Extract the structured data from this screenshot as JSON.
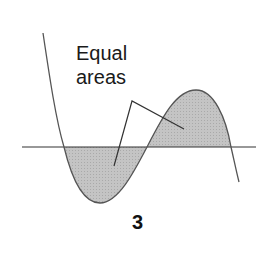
{
  "figure": {
    "annotation": {
      "line1": "Equal",
      "line2": "areas"
    },
    "panel_label": "3",
    "colors": {
      "curve": "#555555",
      "axis": "#333333",
      "fill": "#bdbdbd",
      "pointer": "#333333",
      "background": "#ffffff"
    }
  }
}
